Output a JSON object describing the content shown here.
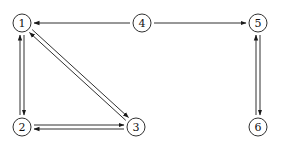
{
  "diagram": {
    "type": "directed-graph",
    "colors": {
      "stroke": "#1a1a1a",
      "background": "#ffffff"
    },
    "node_radius": 9,
    "nodes": [
      {
        "id": "1",
        "label": "1",
        "x": 22,
        "y": 23
      },
      {
        "id": "2",
        "label": "2",
        "x": 22,
        "y": 127
      },
      {
        "id": "3",
        "label": "3",
        "x": 136,
        "y": 127
      },
      {
        "id": "4",
        "label": "4",
        "x": 142,
        "y": 23
      },
      {
        "id": "5",
        "label": "5",
        "x": 258,
        "y": 23
      },
      {
        "id": "6",
        "label": "6",
        "x": 258,
        "y": 127
      }
    ],
    "edges": [
      {
        "from": "4",
        "to": "1",
        "offset": 0
      },
      {
        "from": "4",
        "to": "5",
        "offset": 0
      },
      {
        "from": "1",
        "to": "2",
        "offset": -2
      },
      {
        "from": "2",
        "to": "1",
        "offset": -2
      },
      {
        "from": "1",
        "to": "3",
        "offset": -2
      },
      {
        "from": "3",
        "to": "1",
        "offset": -2
      },
      {
        "from": "3",
        "to": "2",
        "offset": -2
      },
      {
        "from": "2",
        "to": "3",
        "offset": -2
      },
      {
        "from": "5",
        "to": "6",
        "offset": -2
      },
      {
        "from": "6",
        "to": "5",
        "offset": -2
      }
    ]
  }
}
